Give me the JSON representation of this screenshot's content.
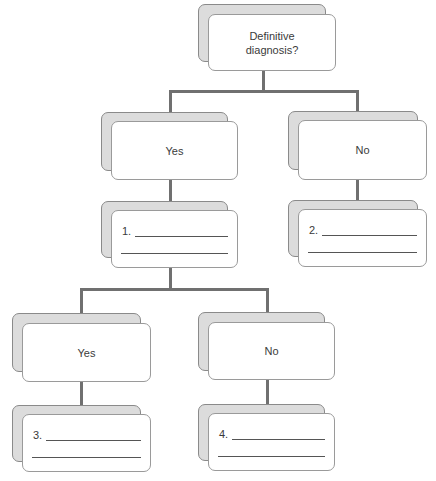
{
  "diagram": {
    "type": "decision-tree",
    "root": {
      "label": "Definitive diagnosis?"
    },
    "branches": [
      {
        "label": "Yes",
        "answer_number": "1.",
        "children": [
          {
            "label": "Yes",
            "answer_number": "3."
          },
          {
            "label": "No",
            "answer_number": "4."
          }
        ]
      },
      {
        "label": "No",
        "answer_number": "2."
      }
    ]
  },
  "colors": {
    "connector": "#707070",
    "back_card": "#dcdcdc",
    "front_card": "#ffffff",
    "border": "#9a9a9a"
  }
}
